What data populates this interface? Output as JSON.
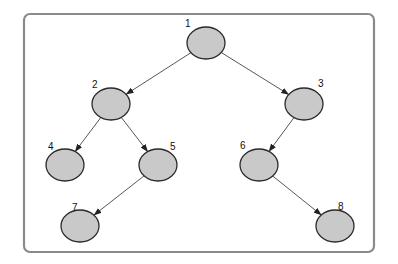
{
  "diagram": {
    "type": "binary-tree",
    "frame": {
      "x": 24,
      "y": 14,
      "width": 350,
      "height": 238,
      "radius": 6,
      "stroke_color": "#8a8a8a"
    },
    "node_style": {
      "rx": 19,
      "ry": 16,
      "fill": "#c9c9c9",
      "stroke": "#2a2a2a"
    },
    "nodes": [
      {
        "id": "1",
        "label": "1",
        "cx": 206,
        "cy": 43,
        "label_x": 185,
        "label_y": 27
      },
      {
        "id": "2",
        "label": "2",
        "cx": 111,
        "cy": 104,
        "label_x": 92,
        "label_y": 88
      },
      {
        "id": "3",
        "label": "3",
        "cx": 304,
        "cy": 104,
        "label_x": 318,
        "label_y": 87
      },
      {
        "id": "4",
        "label": "4",
        "cx": 65,
        "cy": 165,
        "label_x": 48,
        "label_y": 150
      },
      {
        "id": "5",
        "label": "5",
        "cx": 158,
        "cy": 165,
        "label_x": 170,
        "label_y": 150
      },
      {
        "id": "6",
        "label": "6",
        "cx": 259,
        "cy": 165,
        "label_x": 240,
        "label_y": 149
      },
      {
        "id": "7",
        "label": "7",
        "cx": 80,
        "cy": 226,
        "label_x": 72,
        "label_y": 211
      },
      {
        "id": "8",
        "label": "8",
        "cx": 335,
        "cy": 226,
        "label_x": 338,
        "label_y": 210
      }
    ],
    "edges": [
      {
        "from": "1",
        "to": "2"
      },
      {
        "from": "1",
        "to": "3"
      },
      {
        "from": "2",
        "to": "4"
      },
      {
        "from": "2",
        "to": "5"
      },
      {
        "from": "3",
        "to": "6"
      },
      {
        "from": "5",
        "to": "7"
      },
      {
        "from": "6",
        "to": "8"
      }
    ]
  }
}
